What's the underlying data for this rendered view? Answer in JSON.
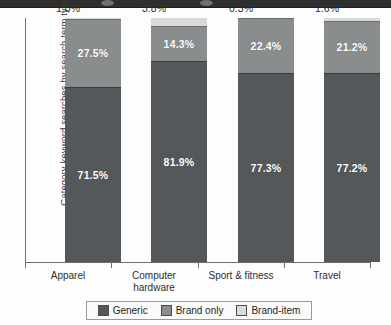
{
  "chrome": {
    "dot_left_label": "window-control",
    "dot_right_label": "window-control"
  },
  "chart_data": {
    "type": "bar",
    "stacked": true,
    "title": "",
    "xlabel": "",
    "ylabel": "Category keyword searches by search term type",
    "categories": [
      "Apparel",
      "Computer hardware",
      "Sport & fitness",
      "Travel"
    ],
    "category_lines": [
      [
        "Apparel"
      ],
      [
        "Computer",
        "hardware"
      ],
      [
        "Sport & fitness"
      ],
      [
        "Travel"
      ]
    ],
    "series": [
      {
        "name": "Generic",
        "color": "#55585a",
        "values": [
          71.5,
          81.9,
          77.3,
          77.2
        ],
        "labels": [
          "71.5%",
          "81.9%",
          "77.3%",
          "77.2%"
        ]
      },
      {
        "name": "Brand only",
        "color": "#8a8d8e",
        "values": [
          27.5,
          14.3,
          22.4,
          21.2
        ],
        "labels": [
          "27.5%",
          "14.3%",
          "22.4%",
          "21.2%"
        ]
      },
      {
        "name": "Brand-item",
        "color": "#d9dbdb",
        "values": [
          1.0,
          3.8,
          0.3,
          1.6
        ],
        "labels": [
          "1.0%",
          "3.8%",
          "0.3%",
          "1.6%"
        ]
      }
    ],
    "top_value_labels": [
      "1.0%",
      "3.8%",
      "0.3%",
      "1.6%"
    ],
    "ylim": [
      0,
      100
    ],
    "grid": false,
    "legend_position": "bottom",
    "legend": [
      "Generic",
      "Brand only",
      "Brand-item"
    ]
  }
}
